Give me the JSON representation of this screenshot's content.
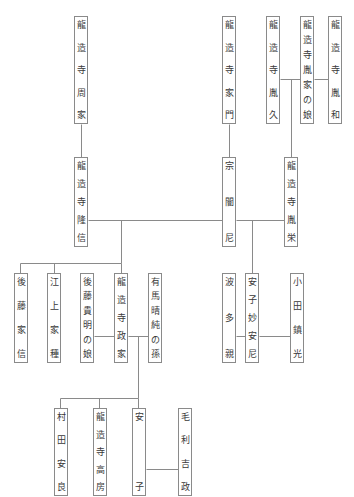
{
  "diagram": {
    "type": "genealogy",
    "line_color": "#8a8a8a",
    "people": [
      {
        "id": "shuuka",
        "name": "龍造寺周家",
        "x": 74,
        "y": 16,
        "w": 14,
        "h": 108
      },
      {
        "id": "iekado",
        "name": "龍造寺家門",
        "x": 222,
        "y": 16,
        "w": 14,
        "h": 108
      },
      {
        "id": "tanehisa",
        "name": "龍造寺胤久",
        "x": 266,
        "y": 16,
        "w": 14,
        "h": 108
      },
      {
        "id": "taneie_musume",
        "name": "龍造寺胤家の娘",
        "x": 300,
        "y": 16,
        "w": 14,
        "h": 108
      },
      {
        "id": "tanekazu",
        "name": "龍造寺胤和",
        "x": 328,
        "y": 16,
        "w": 14,
        "h": 108
      },
      {
        "id": "takanobu",
        "name": "龍造寺隆信",
        "x": 74,
        "y": 157,
        "w": 14,
        "h": 90
      },
      {
        "id": "sogenni",
        "name": "宗闇尼",
        "x": 222,
        "y": 157,
        "w": 14,
        "h": 90
      },
      {
        "id": "taneyoshi",
        "name": "龍造寺胤栄",
        "x": 284,
        "y": 157,
        "w": 14,
        "h": 90
      },
      {
        "id": "goto_ienobu",
        "name": "後藤家信",
        "x": 14,
        "y": 273,
        "w": 14,
        "h": 90
      },
      {
        "id": "egami_ietane",
        "name": "江上家種",
        "x": 47,
        "y": 273,
        "w": 14,
        "h": 90
      },
      {
        "id": "goto_musume",
        "name": "後藤貴明の娘",
        "x": 80,
        "y": 273,
        "w": 14,
        "h": 90
      },
      {
        "id": "masaie",
        "name": "龍造寺政家",
        "x": 114,
        "y": 273,
        "w": 14,
        "h": 90
      },
      {
        "id": "arima_mago",
        "name": "有馬晴純の孫",
        "x": 148,
        "y": 273,
        "w": 14,
        "h": 90
      },
      {
        "id": "hata_chika",
        "name": "波多親",
        "x": 222,
        "y": 273,
        "w": 14,
        "h": 90
      },
      {
        "id": "yasuko_myoanni",
        "name": "安子妙安尼",
        "x": 245,
        "y": 273,
        "w": 14,
        "h": 90
      },
      {
        "id": "oda_shigemitsu",
        "name": "小田鎮光",
        "x": 290,
        "y": 273,
        "w": 14,
        "h": 90
      },
      {
        "id": "murata_yasuyoshi",
        "name": "村田安良",
        "x": 54,
        "y": 408,
        "w": 14,
        "h": 88
      },
      {
        "id": "takafusa",
        "name": "龍造寺高房",
        "x": 93,
        "y": 408,
        "w": 14,
        "h": 88
      },
      {
        "id": "yasuko",
        "name": "安子",
        "x": 132,
        "y": 408,
        "w": 14,
        "h": 88
      },
      {
        "id": "mori_yoshimasa",
        "name": "毛利吉政",
        "x": 178,
        "y": 408,
        "w": 14,
        "h": 88
      }
    ],
    "lines": [
      {
        "from": "shuuka",
        "to": "takanobu",
        "kind": "parent-child",
        "x1": 81,
        "y1": 124,
        "x2": 81,
        "y2": 157
      },
      {
        "from": "iekado",
        "to": "sogenni",
        "kind": "parent-child",
        "x1": 229,
        "y1": 124,
        "x2": 229,
        "y2": 157
      },
      {
        "from": "tanehisa",
        "to": "taneie_musume",
        "kind": "marriage",
        "x1": 280,
        "y1": 79,
        "x2": 300,
        "y2": 79
      },
      {
        "from": "taneie_musume",
        "to": "tanekazu",
        "kind": "marriage",
        "x1": 314,
        "y1": 79,
        "x2": 328,
        "y2": 79
      },
      {
        "from": "tanehisa+taneie_musume",
        "to": "taneyoshi",
        "kind": "parent-child",
        "x1": 291,
        "y1": 79,
        "x2": 291,
        "y2": 157
      },
      {
        "from": "takanobu",
        "to": "sogenni",
        "kind": "marriage",
        "x1": 88,
        "y1": 220,
        "x2": 222,
        "y2": 220
      },
      {
        "from": "sogenni",
        "to": "taneyoshi",
        "kind": "marriage",
        "x1": 236,
        "y1": 220,
        "x2": 284,
        "y2": 220
      },
      {
        "from": "takanobu+sogenni",
        "to": "children",
        "kind": "descent",
        "x1": 121,
        "y1": 220,
        "x2": 121,
        "y2": 263
      },
      {
        "from": "children-bar",
        "to": "",
        "kind": "sibling-bar",
        "x1": 20,
        "y1": 263,
        "x2": 121,
        "y2": 263
      },
      {
        "from": "bar",
        "to": "goto_ienobu",
        "kind": "drop",
        "x1": 20,
        "y1": 263,
        "x2": 20,
        "y2": 273
      },
      {
        "from": "bar",
        "to": "egami_ietane",
        "kind": "drop",
        "x1": 54,
        "y1": 263,
        "x2": 54,
        "y2": 273
      },
      {
        "from": "bar",
        "to": "masaie",
        "kind": "drop",
        "x1": 121,
        "y1": 263,
        "x2": 121,
        "y2": 273
      },
      {
        "from": "sogenni+taneyoshi",
        "to": "yasuko_myoanni",
        "kind": "parent-child",
        "x1": 252,
        "y1": 220,
        "x2": 252,
        "y2": 273
      },
      {
        "from": "goto_musume",
        "to": "masaie",
        "kind": "marriage",
        "x1": 94,
        "y1": 336,
        "x2": 114,
        "y2": 336
      },
      {
        "from": "masaie",
        "to": "arima_mago",
        "kind": "marriage",
        "x1": 128,
        "y1": 336,
        "x2": 148,
        "y2": 336
      },
      {
        "from": "masaie+arima_mago",
        "to": "children2",
        "kind": "descent",
        "x1": 138,
        "y1": 336,
        "x2": 138,
        "y2": 398
      },
      {
        "from": "children2-bar",
        "to": "",
        "kind": "sibling-bar",
        "x1": 60,
        "y1": 398,
        "x2": 138,
        "y2": 398
      },
      {
        "from": "bar2",
        "to": "murata_yasuyoshi",
        "kind": "drop",
        "x1": 60,
        "y1": 398,
        "x2": 60,
        "y2": 408
      },
      {
        "from": "bar2",
        "to": "takafusa",
        "kind": "drop",
        "x1": 99,
        "y1": 398,
        "x2": 99,
        "y2": 408
      },
      {
        "from": "bar2",
        "to": "yasuko",
        "kind": "drop",
        "x1": 138,
        "y1": 398,
        "x2": 138,
        "y2": 408
      },
      {
        "from": "hata_chika",
        "to": "yasuko_myoanni",
        "kind": "marriage",
        "x1": 236,
        "y1": 336,
        "x2": 245,
        "y2": 336
      },
      {
        "from": "yasuko_myoanni",
        "to": "oda_shigemitsu",
        "kind": "marriage",
        "x1": 259,
        "y1": 336,
        "x2": 290,
        "y2": 336
      },
      {
        "from": "yasuko",
        "to": "mori_yoshimasa",
        "kind": "marriage",
        "x1": 146,
        "y1": 469,
        "x2": 178,
        "y2": 469
      }
    ]
  }
}
